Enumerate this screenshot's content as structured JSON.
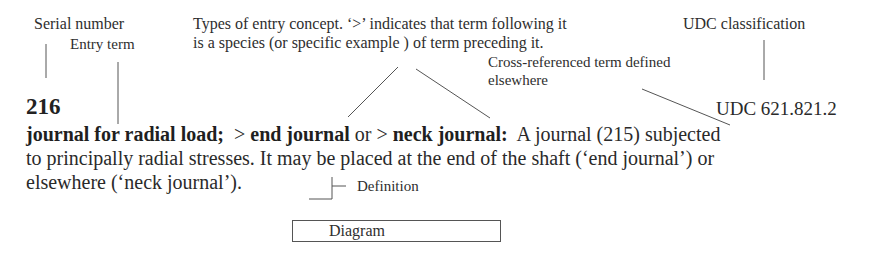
{
  "annotations": {
    "serial_number": "Serial number",
    "entry_term": "Entry term",
    "types_line1": "Types of entry concept. ‘>’ indicates that term following it",
    "types_line2": "is a species (or specific example ) of term preceding it.",
    "udc_classification": "UDC classification",
    "cross_ref_line1": "Cross-referenced term defined",
    "cross_ref_line2": "elsewhere",
    "definition": "Definition",
    "diagram": "Diagram"
  },
  "entry": {
    "serial": "216",
    "udc": "UDC 621.821.2",
    "term": "journal for radial load;",
    "species_marker_1": ">",
    "species_term_1": "end journal",
    "connector": "or",
    "species_marker_2": ">",
    "species_term_2": "neck journal:",
    "definition_part1": "A journal (215) subjected",
    "definition_line2": "to principally radial stresses.  It may be placed at the end of the shaft (‘end  journal’) or",
    "definition_line3": "elsewhere (‘neck journal’)."
  }
}
